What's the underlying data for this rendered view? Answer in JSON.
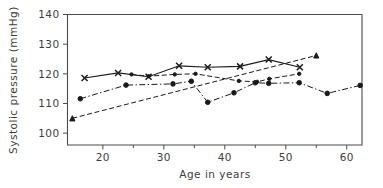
{
  "chart_data": {
    "type": "line",
    "title": "",
    "xlabel": "Age in years",
    "ylabel": "Systolic pressure (mmHg)",
    "xlim": [
      14.2,
      62.5
    ],
    "ylim": [
      96,
      140
    ],
    "grid": false,
    "legend": "none",
    "x_ticks": [
      20,
      30,
      40,
      50,
      60
    ],
    "x_minor_ticks": [
      25,
      35,
      45,
      55
    ],
    "y_ticks": [
      100,
      110,
      120,
      130,
      140
    ],
    "x_tick_labels": [
      "20",
      "30",
      "40",
      "50",
      "60"
    ],
    "y_tick_labels": [
      "100",
      "110",
      "120",
      "130",
      "140"
    ],
    "series": [
      {
        "name": "cross-marker-solid",
        "marker": "x",
        "linestyle": "solid",
        "x": [
          17.0,
          22.5,
          27.5,
          32.5,
          37.2,
          42.5,
          47.2,
          52.3
        ],
        "values": [
          118.6,
          120.3,
          119.0,
          122.7,
          122.2,
          122.5,
          124.8,
          122.2
        ]
      },
      {
        "name": "dot-marker-dashed",
        "marker": "dot",
        "linestyle": "dashed",
        "x": [
          24.7,
          27.5,
          31.8,
          35.2,
          42.3,
          45.3,
          47.3,
          52.2
        ],
        "values": [
          119.8,
          119.2,
          119.8,
          120.0,
          117.6,
          117.3,
          118.3,
          120.0
        ]
      },
      {
        "name": "circle-marker-dashdot",
        "marker": "circle",
        "linestyle": "dashdot",
        "x": [
          16.3,
          23.8,
          31.5,
          34.5,
          37.2,
          41.5,
          45.0,
          47.2,
          52.2,
          56.8,
          62.2
        ],
        "values": [
          111.6,
          116.2,
          116.6,
          117.5,
          110.4,
          113.6,
          117.0,
          116.8,
          117.0,
          113.4,
          116.1
        ]
      },
      {
        "name": "triangle-marker-rising-dashed",
        "marker": "triangle",
        "linestyle": "dashed",
        "x": [
          15.0,
          55.0
        ],
        "values": [
          105.0,
          126.2
        ]
      }
    ]
  }
}
